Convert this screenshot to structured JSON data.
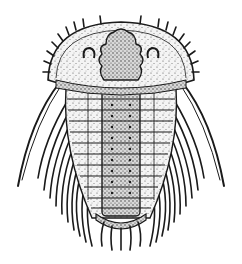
{
  "image": {
    "subject": "trilobite illustration",
    "style": "black-and-white stippled line engraving",
    "background": "#ffffff",
    "ink": "#1a1a1a",
    "parts": [
      "cephalon",
      "cephalic-spines",
      "glabella",
      "eyes",
      "genal-spines",
      "thorax-axis",
      "thoracic-pleurae",
      "pleural-spines",
      "pygidium",
      "pygidial-spines"
    ],
    "thorax_segments": 12
  }
}
